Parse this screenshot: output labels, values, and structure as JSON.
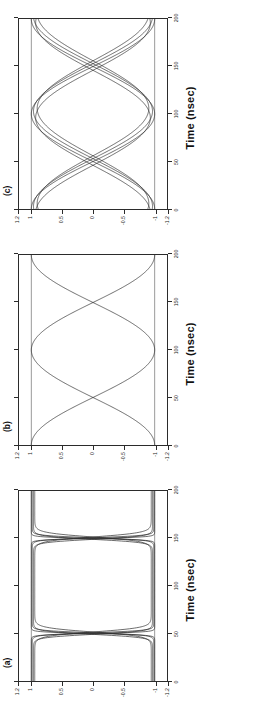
{
  "figure": {
    "width": 260,
    "height": 709,
    "orientation": "rotated-90-ccw",
    "background": "#ffffff",
    "ink_color": "#2b2b2b"
  },
  "panels": [
    {
      "tag": "(c)",
      "chart_data": {
        "type": "line",
        "title": "(c)",
        "xlabel": "Time (nsec)",
        "ylabel": "",
        "xlim": [
          0,
          200
        ],
        "ylim": [
          -1.2,
          1.2
        ],
        "xticks": [
          0,
          50,
          100,
          150,
          200
        ],
        "xticklabels": [
          "0",
          "50",
          "100",
          "150",
          "200"
        ],
        "yticks": [
          -1.2,
          -1,
          -0.5,
          0,
          0.5,
          1,
          1.2
        ],
        "yticklabels": [
          "-1.2",
          "-1",
          "-0.5",
          "0",
          "0.5",
          "1",
          "1.2"
        ],
        "grid": false,
        "legend": false,
        "reference_lines": [
          {
            "axis": "y",
            "value": 1
          },
          {
            "axis": "y",
            "value": -1
          }
        ],
        "description": "Eye diagram: many overlapping sinusoidal traces, period 200 nsec, with amplitude and phase spread producing thick crossing bundles at 50 and 150 nsec.",
        "series": [
          {
            "name": "trace-1",
            "amplitude": 1.0,
            "period": 200,
            "phase_nsec": 0,
            "y_at": {
              "0": -1.0,
              "50": 0.0,
              "100": 1.0,
              "150": 0.0,
              "200": -1.0
            }
          },
          {
            "name": "trace-2",
            "amplitude": 0.97,
            "period": 200,
            "phase_nsec": 3,
            "y_at": {
              "0": -0.96,
              "50": 0.09,
              "100": 0.97,
              "150": -0.09,
              "200": -0.96
            }
          },
          {
            "name": "trace-3",
            "amplitude": 0.93,
            "period": 200,
            "phase_nsec": -4,
            "y_at": {
              "0": -0.92,
              "50": -0.12,
              "100": 0.93,
              "150": 0.12,
              "200": -0.92
            }
          },
          {
            "name": "trace-4",
            "amplitude": 1.0,
            "period": 200,
            "phase_nsec": 100,
            "y_at": {
              "0": 1.0,
              "50": 0.0,
              "100": -1.0,
              "150": 0.0,
              "200": 1.0
            }
          },
          {
            "name": "trace-5",
            "amplitude": 0.97,
            "period": 200,
            "phase_nsec": 103,
            "y_at": {
              "0": 0.96,
              "50": -0.09,
              "100": -0.97,
              "150": 0.09,
              "200": 0.96
            }
          },
          {
            "name": "trace-6",
            "amplitude": 0.93,
            "period": 200,
            "phase_nsec": 96,
            "y_at": {
              "0": 0.92,
              "50": 0.12,
              "100": -0.93,
              "150": -0.12,
              "200": 0.92
            }
          }
        ]
      }
    },
    {
      "tag": "(b)",
      "chart_data": {
        "type": "line",
        "title": "(b)",
        "xlabel": "Time (nsec)",
        "ylabel": "",
        "xlim": [
          0,
          200
        ],
        "ylim": [
          -1.2,
          1.2
        ],
        "xticks": [
          0,
          50,
          100,
          150,
          200
        ],
        "xticklabels": [
          "0",
          "50",
          "100",
          "150",
          "200"
        ],
        "yticks": [
          -1.2,
          -1,
          -0.5,
          0,
          0.5,
          1,
          1.2
        ],
        "yticklabels": [
          "-1.2",
          "-1",
          "-0.5",
          "0",
          "0.5",
          "1",
          "1.2"
        ],
        "grid": false,
        "legend": false,
        "reference_lines": [
          {
            "axis": "y",
            "value": 1
          },
          {
            "axis": "y",
            "value": -1
          }
        ],
        "description": "Eye diagram: clean pair of sinusoidal traces, period 200 nsec, crossing sharply at 50 and 150 nsec, full open eye.",
        "series": [
          {
            "name": "trace-1",
            "amplitude": 1.0,
            "period": 200,
            "phase_nsec": 0,
            "y_at": {
              "0": -1.0,
              "50": 0.0,
              "100": 1.0,
              "150": 0.0,
              "200": -1.0
            }
          },
          {
            "name": "trace-2",
            "amplitude": 1.0,
            "period": 200,
            "phase_nsec": 100,
            "y_at": {
              "0": 1.0,
              "50": 0.0,
              "100": -1.0,
              "150": 0.0,
              "200": 1.0
            }
          }
        ]
      }
    },
    {
      "tag": "(a)",
      "chart_data": {
        "type": "line",
        "title": "(a)",
        "xlabel": "Time (nsec)",
        "ylabel": "",
        "xlim": [
          0,
          200
        ],
        "ylim": [
          -1.2,
          1.2
        ],
        "xticks": [
          0,
          50,
          100,
          150,
          200
        ],
        "xticklabels": [
          "0",
          "50",
          "100",
          "150",
          "200"
        ],
        "yticks": [
          -1.2,
          -1,
          -0.5,
          0,
          0.5,
          1,
          1.2
        ],
        "yticklabels": [
          "-1.2",
          "-1",
          "-0.5",
          "0",
          "0.5",
          "1",
          "1.2"
        ],
        "grid": false,
        "legend": false,
        "reference_lines": [
          {
            "axis": "y",
            "value": 1
          },
          {
            "axis": "y",
            "value": -1
          }
        ],
        "description": "Eye diagram: near-square waveform, flat rails at +1 and -1 with very fast transitions near 50 and 150 nsec, producing a wide rectangular open eye.",
        "series": [
          {
            "name": "trace-1",
            "amplitude": 1.0,
            "period": 200,
            "transition_nsec": [
              50,
              150
            ],
            "rail_high": 1.0,
            "rail_low": -1.0
          },
          {
            "name": "trace-2",
            "amplitude": 0.98,
            "period": 200,
            "transition_nsec": [
              50,
              150
            ],
            "rail_high": 0.98,
            "rail_low": -0.98
          },
          {
            "name": "trace-3",
            "amplitude": 0.95,
            "period": 200,
            "transition_nsec": [
              50,
              150
            ],
            "rail_high": 0.95,
            "rail_low": -0.95
          },
          {
            "name": "trace-4",
            "amplitude": 1.0,
            "period": 200,
            "transition_nsec": [
              50,
              150
            ],
            "rail_high": -1.0,
            "rail_low": 1.0,
            "inverted": true
          }
        ]
      }
    }
  ],
  "axis": {
    "x_title": "Time (nsec)",
    "xticklabels": [
      "0",
      "50",
      "100",
      "150",
      "200"
    ],
    "yticklabels": [
      "-1.2",
      "-1",
      "-0.5",
      "0",
      "0.5",
      "1",
      "1.2"
    ]
  }
}
